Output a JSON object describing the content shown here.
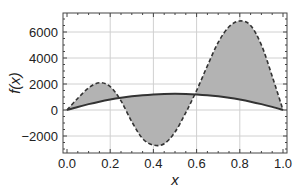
{
  "chart_data": {
    "type": "line",
    "title": "",
    "xlabel": "x",
    "ylabel": "f(x)",
    "xlim": [
      0.0,
      1.0
    ],
    "ylim": [
      -3300,
      7300
    ],
    "grid": true,
    "legend": null,
    "x_ticks": [
      "0.0",
      "0.2",
      "0.4",
      "0.6",
      "0.8",
      "1.0"
    ],
    "x_tick_values": [
      0.0,
      0.2,
      0.4,
      0.6,
      0.8,
      1.0
    ],
    "y_ticks": [
      "-2000",
      "0",
      "2000",
      "4000",
      "6000"
    ],
    "y_tick_values": [
      -2000,
      0,
      2000,
      4000,
      6000
    ],
    "fill_between": {
      "series": [
        "solid",
        "dashed"
      ],
      "color": "#b3b3b3"
    },
    "x": [
      0.0,
      0.05,
      0.1,
      0.15,
      0.2,
      0.25,
      0.3,
      0.35,
      0.4,
      0.45,
      0.5,
      0.55,
      0.6,
      0.65,
      0.7,
      0.75,
      0.8,
      0.85,
      0.9,
      0.95,
      1.0
    ],
    "series": [
      {
        "name": "solid",
        "style": "solid",
        "color": "#333333",
        "values": [
          0,
          238,
          450,
          638,
          800,
          938,
          1050,
          1138,
          1200,
          1238,
          1250,
          1238,
          1200,
          1138,
          1050,
          938,
          800,
          638,
          450,
          238,
          0
        ]
      },
      {
        "name": "dashed",
        "style": "dashed",
        "color": "#333333",
        "values": [
          0,
          900,
          1700,
          2100,
          1800,
          700,
          -900,
          -2200,
          -2700,
          -2600,
          -1700,
          -200,
          1500,
          3400,
          5200,
          6400,
          6850,
          6500,
          5000,
          2600,
          0
        ]
      }
    ]
  },
  "colors": {
    "fill": "#b3b3b3",
    "grid": "#d0d0d0",
    "frame": "#444444",
    "line": "#333333"
  }
}
